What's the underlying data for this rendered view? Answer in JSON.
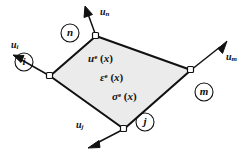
{
  "figure": {
    "element_fill": "#ebebeb",
    "line_color": "#111111",
    "node_marker_fill": "#ffffff"
  },
  "element": {
    "vertices": [
      {
        "name": "n",
        "x": 96,
        "y": 36
      },
      {
        "name": "m",
        "x": 191,
        "y": 70
      },
      {
        "name": "j",
        "x": 124,
        "y": 129
      },
      {
        "name": "i",
        "x": 50,
        "y": 76
      }
    ]
  },
  "nodes": [
    {
      "id": "i",
      "label": "i",
      "circle_x": 24,
      "circle_y": 62,
      "r": 9
    },
    {
      "id": "j",
      "label": "j",
      "circle_x": 145,
      "circle_y": 122,
      "r": 9
    },
    {
      "id": "m",
      "label": "m",
      "circle_x": 204,
      "circle_y": 92,
      "r": 9
    },
    {
      "id": "n",
      "label": "n",
      "circle_x": 70,
      "circle_y": 33,
      "r": 9
    }
  ],
  "vectors": [
    {
      "id": "u-i",
      "label_base": "u",
      "label_sub": "i",
      "from_x": 50,
      "from_y": 76,
      "to_x": 17,
      "to_y": 57,
      "label_x": 11,
      "label_y": 40
    },
    {
      "id": "u-j",
      "label_base": "u",
      "label_sub": "j",
      "from_x": 124,
      "from_y": 129,
      "to_x": 91,
      "to_y": 146,
      "label_x": 76,
      "label_y": 120
    },
    {
      "id": "u-m",
      "label_base": "u",
      "label_sub": "m",
      "from_x": 191,
      "from_y": 70,
      "to_x": 224,
      "to_y": 44,
      "label_x": 226,
      "label_y": 52
    },
    {
      "id": "u-n",
      "label_base": "u",
      "label_sub": "n",
      "from_x": 96,
      "from_y": 36,
      "to_x": 86,
      "to_y": 9,
      "label_x": 100,
      "label_y": 7
    }
  ],
  "fields": [
    {
      "id": "displacement-field",
      "base": "u",
      "sup": "e",
      "arg_open": " (",
      "arg_var": "x",
      "arg_close": ")",
      "x": 88,
      "y": 53
    },
    {
      "id": "strain-field",
      "base": "ε",
      "sup": "e",
      "arg_open": " (",
      "arg_var": "x",
      "arg_close": ")",
      "x": 100,
      "y": 72
    },
    {
      "id": "stress-field",
      "base": "σ",
      "sup": "e",
      "arg_open": " (",
      "arg_var": "x",
      "arg_close": ")",
      "x": 112,
      "y": 91
    }
  ]
}
